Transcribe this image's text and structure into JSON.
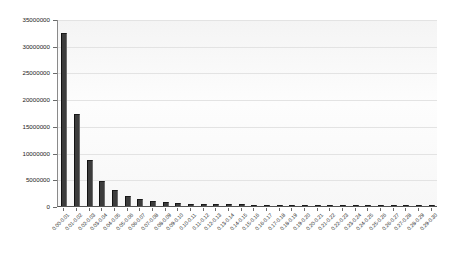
{
  "chart_data": {
    "type": "bar",
    "title": "",
    "xlabel": "",
    "ylabel": "",
    "ylim": [
      0,
      35000000
    ],
    "grid": "horizontal",
    "legend": "none",
    "bar_color": "#3c3c3c",
    "plot_background": "#fbfbfb",
    "axis_color": "#555555",
    "gridline_color": "#e3e3e3",
    "ytick_labels": [
      "0",
      "5000000",
      "10000000",
      "15000000",
      "20000000",
      "25000000",
      "30000000",
      "35000000"
    ],
    "ytick_values": [
      0,
      5000000,
      10000000,
      15000000,
      20000000,
      25000000,
      30000000,
      35000000
    ],
    "categories": [
      "0.00-0.01",
      "0.01-0.02",
      "0.02-0.03",
      "0.03-0.04",
      "0.04-0.05",
      "0.05-0.06",
      "0.06-0.07",
      "0.07-0.08",
      "0.08-0.09",
      "0.09-0.10",
      "0.10-0.11",
      "0.11-0.12",
      "0.12-0.13",
      "0.13-0.14",
      "0.14-0.15",
      "0.15-0.16",
      "0.16-0.17",
      "0.17-0.18",
      "0.18-0.19",
      "0.19-0.20",
      "0.20-0.21",
      "0.21-0.22",
      "0.22-0.23",
      "0.23-0.24",
      "0.24-0.25",
      "0.25-0.26",
      "0.26-0.27",
      "0.27-0.28",
      "0.28-0.29",
      "0.29-0.30"
    ],
    "values": [
      32300000,
      17200000,
      8700000,
      4700000,
      3000000,
      1900000,
      1300000,
      950000,
      700000,
      560000,
      470000,
      410000,
      360000,
      320000,
      290000,
      265000,
      245000,
      225000,
      210000,
      195000,
      182000,
      170000,
      160000,
      150000,
      142000,
      134000,
      127000,
      120000,
      114000,
      108000
    ]
  }
}
